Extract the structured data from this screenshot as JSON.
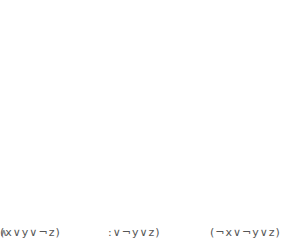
{
  "diagram": {
    "columns": [
      {
        "id": "c1",
        "box": {
          "x": 17,
          "y": 37,
          "w": 40,
          "h": 182
        },
        "nodes": [
          {
            "id": "c1x",
            "label": "x",
            "cx": 37,
            "cy": 62,
            "shaded": false
          },
          {
            "id": "c1ny",
            "label": "¬y",
            "cx": 37,
            "cy": 130,
            "shaded": false
          },
          {
            "id": "c1z",
            "label": "z",
            "cx": 37,
            "cy": 198,
            "shaded": true
          }
        ]
      },
      {
        "id": "c2",
        "box": {
          "x": 120,
          "y": 37,
          "w": 40,
          "h": 182
        },
        "nodes": [
          {
            "id": "c2nx",
            "label": "¬x",
            "cx": 140,
            "cy": 62,
            "shaded": true
          },
          {
            "id": "c2ny",
            "label": "¬ y",
            "cx": 140,
            "cy": 130,
            "shaded": false
          },
          {
            "id": "c2z",
            "label": "z",
            "cx": 140,
            "cy": 198,
            "shaded": false
          }
        ]
      },
      {
        "id": "c3",
        "box": {
          "x": 218,
          "y": 37,
          "w": 40,
          "h": 182
        },
        "nodes": [
          {
            "id": "c3x",
            "label": "x",
            "cx": 238,
            "cy": 62,
            "shaded": false
          },
          {
            "id": "c3y",
            "label": "y",
            "cx": 238,
            "cy": 130,
            "shaded": true
          },
          {
            "id": "c3nz",
            "label": "¬ z",
            "cx": 238,
            "cy": 198,
            "shaded": false
          }
        ]
      }
    ],
    "edges_thick": [
      [
        "c1z",
        "c2nx"
      ],
      [
        "c2nx",
        "c3y"
      ],
      [
        "c1z",
        "c3y"
      ]
    ],
    "edges_thin": [
      [
        "c1x",
        "c2ny"
      ],
      [
        "c1x",
        "c2z"
      ],
      [
        "c1x",
        "c3y"
      ],
      [
        "c1x",
        "c3nz"
      ],
      [
        "c1ny",
        "c2nx"
      ],
      [
        "c1ny",
        "c2ny"
      ],
      [
        "c1ny",
        "c2z"
      ],
      [
        "c1ny",
        "c3x"
      ],
      [
        "c1ny",
        "c3nz"
      ],
      [
        "c1z",
        "c2ny"
      ],
      [
        "c1z",
        "c2z"
      ],
      [
        "c1z",
        "c3x"
      ],
      [
        "c2nx",
        "c3nz"
      ],
      [
        "c2ny",
        "c3x"
      ],
      [
        "c2ny",
        "c3nz"
      ],
      [
        "c2z",
        "c3x"
      ],
      [
        "c2z",
        "c3y"
      ]
    ],
    "curves": [
      {
        "name": "arc-top-outer",
        "d": "M 33 50 C 60 10, 200 5, 250 40 C 300 75, 300 160, 248 200"
      },
      {
        "name": "arc-top-inner",
        "d": "M 35 50 C 70 22, 200 20, 232 52"
      },
      {
        "name": "arc-right-loop",
        "d": "M 246 52 C 268 70, 272 180, 249 202"
      },
      {
        "name": "arc-bottom",
        "d": "M 46 203 C 120 218, 210 220, 252 195"
      }
    ],
    "styles": {
      "edge_thin_color": "#9a9a9a",
      "edge_thick_color": "#222222",
      "node_fill": "#ffffff",
      "node_shaded_fill": "#e6e6e6",
      "node_stroke": "#888888",
      "box_stroke": "#777777",
      "node_radius": 10
    }
  },
  "formula": {
    "clauses": [
      {
        "text": ":∨¬y∨z)",
        "left": 6
      },
      {
        "text": "(¬x∨¬y∨z)",
        "left": 108
      },
      {
        "text": "(x∨y∨¬z)",
        "left": 210
      }
    ],
    "and_symbols": [
      {
        "text": "∧",
        "left": 80
      },
      {
        "text": "∧",
        "left": 188
      }
    ]
  }
}
